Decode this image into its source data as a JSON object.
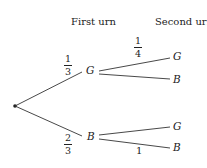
{
  "headers": {
    "first": "First urn",
    "second": "Second urn"
  },
  "nodes": {
    "first_top": "G",
    "first_bottom": "B",
    "second_tg": "G",
    "second_tb": "B",
    "second_bg": "G",
    "second_bb": "B"
  },
  "edges": {
    "root_to_G": {
      "num": "1",
      "den": "3"
    },
    "root_to_B": {
      "num": "2",
      "den": "3"
    },
    "G_to_G": {
      "num": "1",
      "den": "4"
    },
    "B_to_B": "1"
  }
}
